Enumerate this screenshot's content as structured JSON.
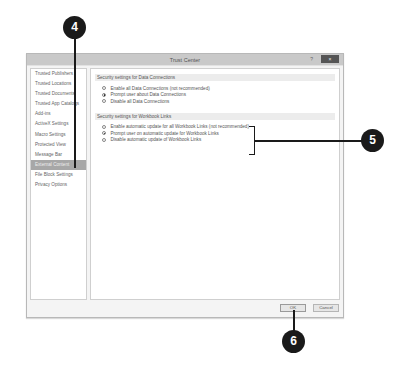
{
  "dialog": {
    "title": "Trust Center",
    "help_label": "?",
    "close_label": "×"
  },
  "sidebar": {
    "items": [
      {
        "label": "Trusted Publishers"
      },
      {
        "label": "Trusted Locations"
      },
      {
        "label": "Trusted Documents"
      },
      {
        "label": "Trusted App Catalogs"
      },
      {
        "label": "Add-ins"
      },
      {
        "label": "ActiveX Settings"
      },
      {
        "label": "Macro Settings"
      },
      {
        "label": "Protected View"
      },
      {
        "label": "Message Bar"
      },
      {
        "label": "External Content",
        "selected": true
      },
      {
        "label": "File Block Settings"
      },
      {
        "label": "Privacy Options"
      }
    ]
  },
  "content": {
    "sections": [
      {
        "heading": "Security settings for Data Connections",
        "options": [
          {
            "label": "Enable all Data Connections (not recommended)",
            "checked": false
          },
          {
            "label": "Prompt user about Data Connections",
            "checked": true
          },
          {
            "label": "Disable all Data Connections",
            "checked": false
          }
        ]
      },
      {
        "heading": "Security settings for Workbook Links",
        "options": [
          {
            "label": "Enable automatic update for all Workbook Links (not recommended)",
            "checked": false
          },
          {
            "label": "Prompt user on automatic update for Workbook Links",
            "checked": true
          },
          {
            "label": "Disable automatic update of Workbook Links",
            "checked": false
          }
        ]
      }
    ]
  },
  "footer": {
    "ok_label": "OK",
    "cancel_label": "Cancel"
  },
  "callouts": {
    "c4": "4",
    "c5": "5",
    "c6": "6"
  }
}
